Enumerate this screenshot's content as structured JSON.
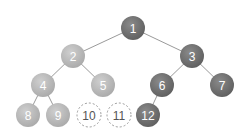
{
  "diagram": {
    "type": "binary-tree",
    "colors": {
      "dark_node": "#6b6b6b",
      "light_node": "#b9b9b9",
      "empty_node_border": "#9a9a9a",
      "edge": "#9a9a9a",
      "filled_text": "#ffffff",
      "empty_text": "#555555"
    },
    "nodes": [
      {
        "id": "1",
        "label": "1",
        "x": 133,
        "y": 28,
        "style": "dark"
      },
      {
        "id": "2",
        "label": "2",
        "x": 73,
        "y": 56,
        "style": "light"
      },
      {
        "id": "3",
        "label": "3",
        "x": 192,
        "y": 56,
        "style": "dark"
      },
      {
        "id": "4",
        "label": "4",
        "x": 43,
        "y": 85,
        "style": "light"
      },
      {
        "id": "5",
        "label": "5",
        "x": 103,
        "y": 85,
        "style": "light"
      },
      {
        "id": "6",
        "label": "6",
        "x": 162,
        "y": 85,
        "style": "dark"
      },
      {
        "id": "7",
        "label": "7",
        "x": 222,
        "y": 85,
        "style": "dark"
      },
      {
        "id": "8",
        "label": "8",
        "x": 28,
        "y": 115,
        "style": "light"
      },
      {
        "id": "9",
        "label": "9",
        "x": 58,
        "y": 115,
        "style": "light"
      },
      {
        "id": "10",
        "label": "10",
        "x": 89,
        "y": 115,
        "style": "empty"
      },
      {
        "id": "11",
        "label": "11",
        "x": 119,
        "y": 115,
        "style": "empty"
      },
      {
        "id": "12",
        "label": "12",
        "x": 148,
        "y": 115,
        "style": "dark"
      }
    ],
    "edges": [
      {
        "from": "1",
        "to": "2"
      },
      {
        "from": "1",
        "to": "3"
      },
      {
        "from": "2",
        "to": "4"
      },
      {
        "from": "2",
        "to": "5"
      },
      {
        "from": "3",
        "to": "6"
      },
      {
        "from": "3",
        "to": "7"
      },
      {
        "from": "4",
        "to": "8"
      },
      {
        "from": "4",
        "to": "9"
      },
      {
        "from": "6",
        "to": "12"
      }
    ],
    "node_radius": 12
  }
}
